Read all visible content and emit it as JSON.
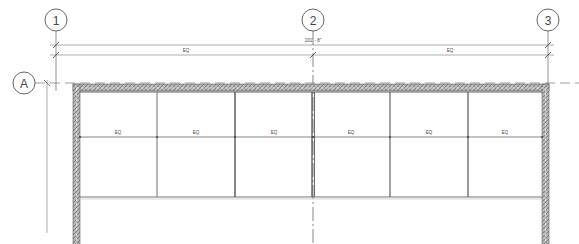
{
  "drawing": {
    "type": "architectural-plan",
    "grid_columns": [
      {
        "label": "1",
        "x": 56
      },
      {
        "label": "2",
        "x": 313
      },
      {
        "label": "3",
        "x": 548
      }
    ],
    "grid_rows": [
      {
        "label": "A",
        "y": 83
      }
    ],
    "overall_dimension": "101' - 8\"",
    "segment_dimensions": [
      "EQ",
      "EQ"
    ],
    "panel_labels": [
      "EQ",
      "EQ",
      "EQ",
      "EQ",
      "EQ",
      "EQ"
    ],
    "colors": {
      "line": "#555555",
      "wall_hatch": "#8a8a8a",
      "background": "#ffffff"
    }
  }
}
